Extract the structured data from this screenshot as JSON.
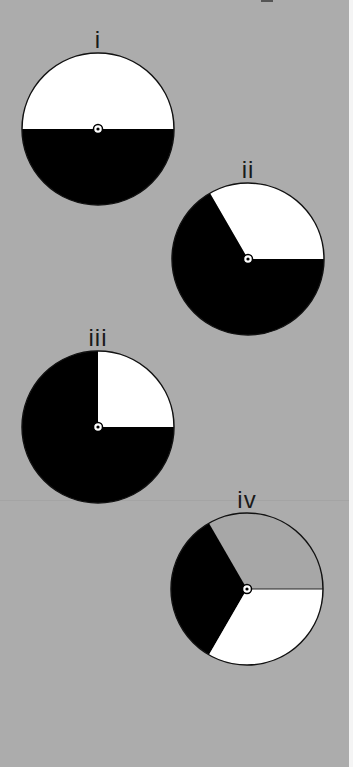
{
  "colors": {
    "background": "#acacac",
    "white": "#ffffff",
    "black": "#000000",
    "gray": "#a7a7a7",
    "outline": "#111111"
  },
  "spinners": [
    {
      "label": "i",
      "sectors": [
        {
          "color": "white",
          "start_deg": 0,
          "end_deg": 180,
          "fraction": "1/2"
        },
        {
          "color": "black",
          "start_deg": 180,
          "end_deg": 360,
          "fraction": "1/2"
        }
      ]
    },
    {
      "label": "ii",
      "sectors": [
        {
          "color": "white",
          "start_deg": 0,
          "end_deg": 120,
          "fraction": "1/3"
        },
        {
          "color": "black",
          "start_deg": 120,
          "end_deg": 360,
          "fraction": "2/3"
        }
      ]
    },
    {
      "label": "iii",
      "sectors": [
        {
          "color": "white",
          "start_deg": 0,
          "end_deg": 90,
          "fraction": "1/4"
        },
        {
          "color": "black",
          "start_deg": 90,
          "end_deg": 360,
          "fraction": "3/4"
        }
      ]
    },
    {
      "label": "iv",
      "sectors": [
        {
          "color": "gray",
          "start_deg": 0,
          "end_deg": 120,
          "fraction": "1/3"
        },
        {
          "color": "black",
          "start_deg": 120,
          "end_deg": 240,
          "fraction": "1/3"
        },
        {
          "color": "white",
          "start_deg": 240,
          "end_deg": 360,
          "fraction": "1/3"
        }
      ]
    }
  ]
}
